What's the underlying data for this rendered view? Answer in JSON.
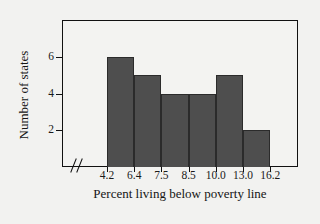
{
  "chart_data": {
    "type": "bar",
    "title": "",
    "subtitle": "",
    "xlabel": "Percent living below poverty line",
    "ylabel": "Number of states",
    "categories": [
      "4.2-6.4",
      "6.4-7.5",
      "7.5-8.5",
      "8.5-10.0",
      "10.0-13.0",
      "13.0-16.2"
    ],
    "values": [
      6,
      5,
      4,
      4,
      5,
      2
    ],
    "bin_edges": [
      "4.2",
      "6.4",
      "7.5",
      "8.5",
      "10.0",
      "13.0",
      "16.2"
    ],
    "xtick_labels": [
      "4.2",
      "6.4",
      "7.5",
      "8.5",
      "10.0",
      "13.0",
      "16.2"
    ],
    "ytick_labels": [
      "2",
      "4",
      "6"
    ],
    "ytick_values": [
      2,
      4,
      6
    ],
    "ylim": [
      0,
      8
    ],
    "grid": false,
    "legend": null,
    "axis_break": "//",
    "bar_color": "#4e4e4e",
    "frame_color": "#111111",
    "background_color": "#f2f2f0"
  }
}
